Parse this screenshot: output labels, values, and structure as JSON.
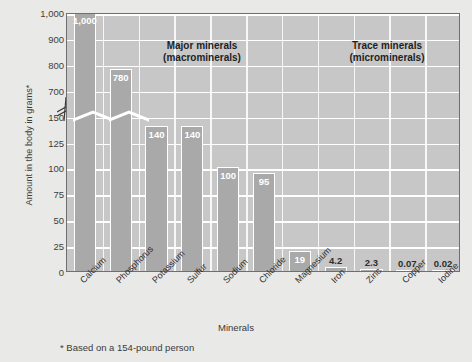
{
  "chart_data": {
    "type": "bar",
    "title": "",
    "xlabel": "Minerals",
    "ylabel": "Amount in the body in grams*",
    "footnote": "* Based on a 154-pound person",
    "categories": [
      "Calcium",
      "Phosphorus",
      "Potassium",
      "Sulfur",
      "Sodium",
      "Chloride",
      "Magnesium",
      "Iron",
      "Zinc",
      "Copper",
      "Iodine"
    ],
    "values": [
      1000,
      780,
      140,
      140,
      100,
      95,
      19,
      4.2,
      2.3,
      0.07,
      0.02
    ],
    "value_labels": [
      "1,000",
      "780",
      "140",
      "140",
      "100",
      "95",
      "19",
      "4.2",
      "2.3",
      "0.07",
      "0.02"
    ],
    "ytick_labels": [
      "0",
      "25",
      "50",
      "75",
      "100",
      "125",
      "150",
      "700",
      "800",
      "900",
      "1,000"
    ],
    "ytick_values": [
      0,
      25,
      50,
      75,
      100,
      125,
      150,
      700,
      800,
      900,
      1000
    ],
    "axis_break": true,
    "axis_break_between": [
      150,
      700
    ],
    "grid": true,
    "legend_position": "none",
    "groups": [
      {
        "label_line1": "Major minerals",
        "label_line2": "(macrominerals)",
        "categories": [
          "Calcium",
          "Phosphorus",
          "Potassium",
          "Sulfur",
          "Sodium",
          "Chloride",
          "Magnesium"
        ]
      },
      {
        "label_line1": "Trace minerals",
        "label_line2": "(microminerals)",
        "categories": [
          "Iron",
          "Zinc",
          "Copper",
          "Iodine"
        ]
      }
    ],
    "colors": {
      "bar_fill": "#a9a9a9",
      "bar_outline": "#ffffff",
      "plot_background": "#c7c7c7",
      "page_background": "#e9e9e7",
      "gridline": "#ffffff",
      "axis": "#6f6f6f",
      "text": "#3a3a3a"
    }
  }
}
